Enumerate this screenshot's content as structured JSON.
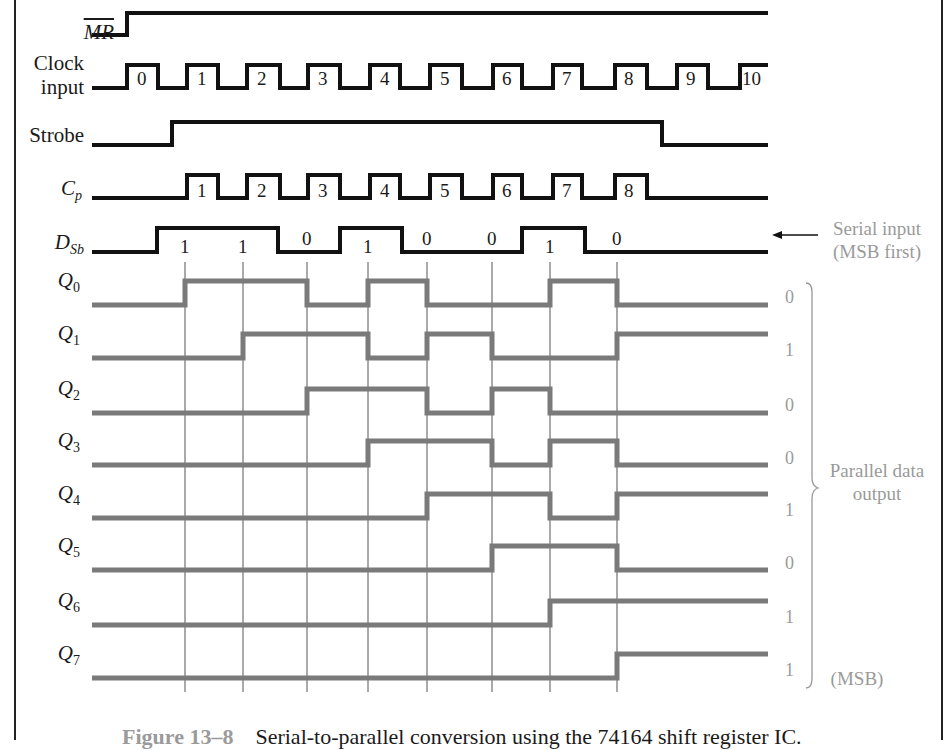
{
  "figure": {
    "caption_number": "Figure 13–8",
    "caption_text": "Serial-to-parallel conversion using the 74164 shift register IC."
  },
  "signals": {
    "mr": {
      "label": "MR",
      "overbar": true
    },
    "clock": {
      "label_line1": "Clock",
      "label_line2": "input",
      "pulse_labels": [
        "0",
        "1",
        "2",
        "3",
        "4",
        "5",
        "6",
        "7",
        "8",
        "9",
        "10"
      ]
    },
    "strobe": {
      "label": "Strobe"
    },
    "cp": {
      "label": "C",
      "subscript": "p",
      "pulse_labels": [
        "1",
        "2",
        "3",
        "4",
        "5",
        "6",
        "7",
        "8"
      ]
    },
    "dsb": {
      "label": "D",
      "subscript": "Sb",
      "bit_labels": [
        "1",
        "1",
        "0",
        "1",
        "0",
        "0",
        "1",
        "0"
      ]
    },
    "q": [
      {
        "label": "Q",
        "subscript": "0",
        "final": "0"
      },
      {
        "label": "Q",
        "subscript": "1",
        "final": "1"
      },
      {
        "label": "Q",
        "subscript": "2",
        "final": "0"
      },
      {
        "label": "Q",
        "subscript": "3",
        "final": "0"
      },
      {
        "label": "Q",
        "subscript": "4",
        "final": "1"
      },
      {
        "label": "Q",
        "subscript": "5",
        "final": "0"
      },
      {
        "label": "Q",
        "subscript": "6",
        "final": "1"
      },
      {
        "label": "Q",
        "subscript": "7",
        "final": "1"
      }
    ]
  },
  "annotations": {
    "serial_input_line1": "Serial input",
    "serial_input_line2": "(MSB first)",
    "parallel_line1": "Parallel data",
    "parallel_line2": "output",
    "msb": "(MSB)"
  },
  "colors": {
    "input_trace": "#111111",
    "output_trace": "#7a7a7a",
    "annotation": "#9a9a9a"
  },
  "chart_data": {
    "type": "timing-diagram",
    "title": "Serial-to-parallel conversion using the 74164 shift register IC",
    "clock_pulses": [
      0,
      1,
      2,
      3,
      4,
      5,
      6,
      7,
      8,
      9,
      10
    ],
    "strobe_active_pulses": [
      1,
      2,
      3,
      4,
      5,
      6,
      7,
      8
    ],
    "serial_input_msb_first": [
      1,
      1,
      0,
      1,
      0,
      0,
      1,
      0
    ],
    "parallel_output": {
      "Q0": 0,
      "Q1": 1,
      "Q2": 0,
      "Q3": 0,
      "Q4": 1,
      "Q5": 0,
      "Q6": 1,
      "Q7": 1
    },
    "q_states_after_each_cp": {
      "Q0": [
        1,
        1,
        0,
        1,
        0,
        0,
        1,
        0
      ],
      "Q1": [
        0,
        1,
        1,
        0,
        1,
        0,
        0,
        1
      ],
      "Q2": [
        0,
        0,
        1,
        1,
        0,
        1,
        0,
        0
      ],
      "Q3": [
        0,
        0,
        0,
        1,
        1,
        0,
        1,
        0
      ],
      "Q4": [
        0,
        0,
        0,
        0,
        1,
        1,
        0,
        1
      ],
      "Q5": [
        0,
        0,
        0,
        0,
        0,
        1,
        1,
        0
      ],
      "Q6": [
        0,
        0,
        0,
        0,
        0,
        0,
        1,
        1
      ],
      "Q7": [
        0,
        0,
        0,
        0,
        0,
        0,
        0,
        1
      ]
    }
  }
}
